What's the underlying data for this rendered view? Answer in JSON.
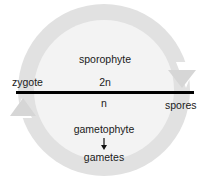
{
  "diagram": {
    "type": "life-cycle",
    "colors": {
      "ring": "#dcdcdc",
      "interior": "#f2f2f2",
      "divider": "#000000",
      "text": "#1a1a1a"
    },
    "labels": {
      "sporophyte": "sporophyte",
      "diploid": "2n",
      "zygote": "zygote",
      "haploid": "n",
      "spores": "spores",
      "gametophyte": "gametophyte",
      "gametes": "gametes"
    },
    "flow": [
      {
        "from": "zygote",
        "to": "spores",
        "phase": "2n",
        "direction": "clockwise-top"
      },
      {
        "from": "spores",
        "to": "gametophyte",
        "phase": "n"
      },
      {
        "from": "gametophyte",
        "to": "gametes",
        "phase": "n"
      },
      {
        "from": "gametes",
        "to": "zygote",
        "phase": "n",
        "direction": "clockwise-bottom"
      }
    ]
  }
}
